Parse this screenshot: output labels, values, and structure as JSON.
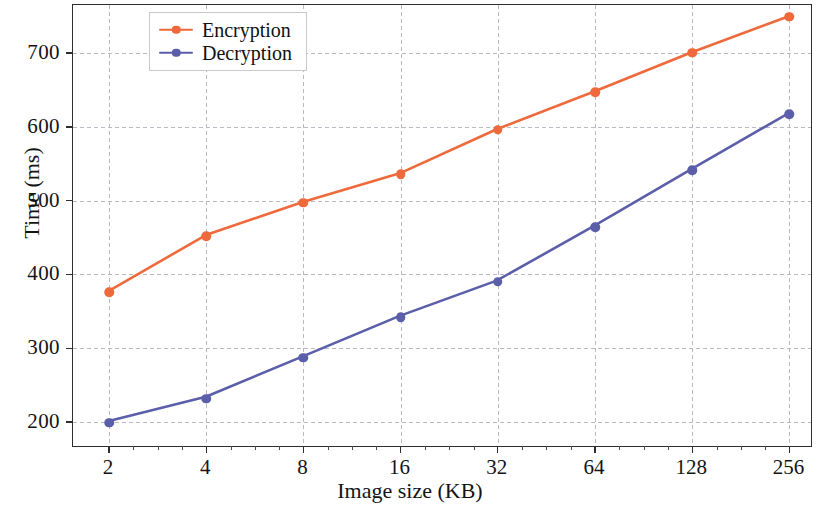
{
  "chart_data": {
    "type": "line",
    "title": "",
    "xlabel": "Image size (KB)",
    "ylabel": "Time (ms)",
    "categories": [
      "2",
      "4",
      "8",
      "16",
      "32",
      "64",
      "128",
      "256"
    ],
    "x_tick_labels": [
      "2",
      "4",
      "8",
      "16",
      "32",
      "64",
      "128",
      "256"
    ],
    "y_tick_labels": [
      "200",
      "300",
      "400",
      "500",
      "600",
      "700"
    ],
    "y_ticks": [
      200,
      300,
      400,
      500,
      600,
      700
    ],
    "ylim": [
      165,
      765
    ],
    "grid": true,
    "legend_position": "upper-left",
    "series": [
      {
        "name": "Encryption",
        "color": "#ee6a3c",
        "marker": "circle",
        "values": [
          376,
          452,
          497,
          536,
          596,
          647,
          700,
          749
        ]
      },
      {
        "name": "Decryption",
        "color": "#5b5ea8",
        "marker": "circle",
        "values": [
          199,
          232,
          287,
          342,
          390,
          464,
          541,
          617
        ]
      }
    ]
  },
  "legend": {
    "items": [
      {
        "label": "Encryption",
        "color": "#ee6a3c"
      },
      {
        "label": "Decryption",
        "color": "#5b5ea8"
      }
    ]
  },
  "axes": {
    "x_title": "Image size (KB)",
    "y_title": "Time (ms)"
  }
}
